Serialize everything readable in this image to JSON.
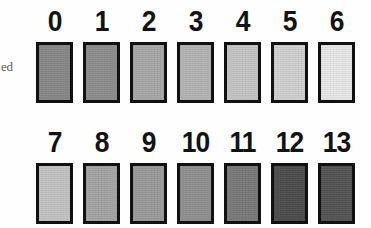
{
  "figure": {
    "edge_caption": "ed",
    "background_color": "#fefefe",
    "swatch_border_color": "#111111",
    "label_color": "#131313"
  },
  "chart_data": {
    "type": "heatmap",
    "title": "",
    "subtitle": "",
    "xlabel": "",
    "ylabel": "",
    "legend_position": "none",
    "grid": false,
    "categories": [
      "0",
      "1",
      "2",
      "3",
      "4",
      "5",
      "6",
      "7",
      "8",
      "9",
      "10",
      "11",
      "12",
      "13"
    ],
    "values": [
      53,
      55,
      65,
      70,
      77,
      81,
      90,
      76,
      64,
      60,
      56,
      47,
      30,
      33
    ],
    "value_unit": "percent reflectance (0 = black, 100 = white)",
    "colors": [
      "#878787",
      "#8c8c8c",
      "#a6a6a6",
      "#b3b3b3",
      "#c4c4c4",
      "#cfcfcf",
      "#e6e6e6",
      "#c2c2c2",
      "#a3a3a3",
      "#999999",
      "#8f8f8f",
      "#787878",
      "#4d4d4d",
      "#545454"
    ],
    "rows": [
      {
        "row_index": 1,
        "swatches": [
          {
            "label": "0",
            "color": "#878787",
            "value": 53
          },
          {
            "label": "1",
            "color": "#8c8c8c",
            "value": 55
          },
          {
            "label": "2",
            "color": "#a6a6a6",
            "value": 65
          },
          {
            "label": "3",
            "color": "#b3b3b3",
            "value": 70
          },
          {
            "label": "4",
            "color": "#c4c4c4",
            "value": 77
          },
          {
            "label": "5",
            "color": "#cfcfcf",
            "value": 81
          },
          {
            "label": "6",
            "color": "#e6e6e6",
            "value": 90
          }
        ]
      },
      {
        "row_index": 2,
        "swatches": [
          {
            "label": "7",
            "color": "#c2c2c2",
            "value": 76
          },
          {
            "label": "8",
            "color": "#a3a3a3",
            "value": 64
          },
          {
            "label": "9",
            "color": "#999999",
            "value": 60
          },
          {
            "label": "10",
            "color": "#8f8f8f",
            "value": 56
          },
          {
            "label": "11",
            "color": "#787878",
            "value": 47
          },
          {
            "label": "12",
            "color": "#4d4d4d",
            "value": 30
          },
          {
            "label": "13",
            "color": "#545454",
            "value": 33
          }
        ]
      }
    ]
  }
}
